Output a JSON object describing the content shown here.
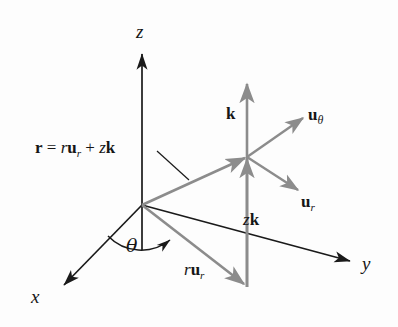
{
  "figure": {
    "background_color": "#fdfdfd",
    "axis_color": "#1a1a1a",
    "vector_color": "#8c8c8c",
    "labels": {
      "axis_z": "z",
      "axis_y": "y",
      "axis_x": "x",
      "angle_theta": "θ",
      "position_vector_equation": {
        "bold_r": "r",
        "equals": "=",
        "scalar_r": "r",
        "bold_u": "u",
        "sub_r": "r",
        "plus": "+",
        "scalar_z": "z",
        "bold_k": "k"
      },
      "unit_k": "k",
      "unit_u_theta": {
        "bold_u": "u",
        "sub_theta": "θ"
      },
      "unit_u_r": {
        "bold_u": "u",
        "sub_r": "r"
      },
      "component_zk": {
        "scalar_z": "z",
        "bold_k": "k"
      },
      "component_r_u_r": {
        "scalar_r": "r",
        "bold_u": "u",
        "sub_r": "r"
      }
    },
    "geometry": {
      "origin": "142,205",
      "z_axis_tip": "142,52",
      "y_axis_tip": "352,262",
      "x_axis_tip": "62,287",
      "junction_point": "247,157",
      "k_axis_tip": "247,82",
      "r_u_r_tip": "245,287",
      "u_theta_tip": "305,116",
      "u_r_tip": "300,192"
    }
  }
}
